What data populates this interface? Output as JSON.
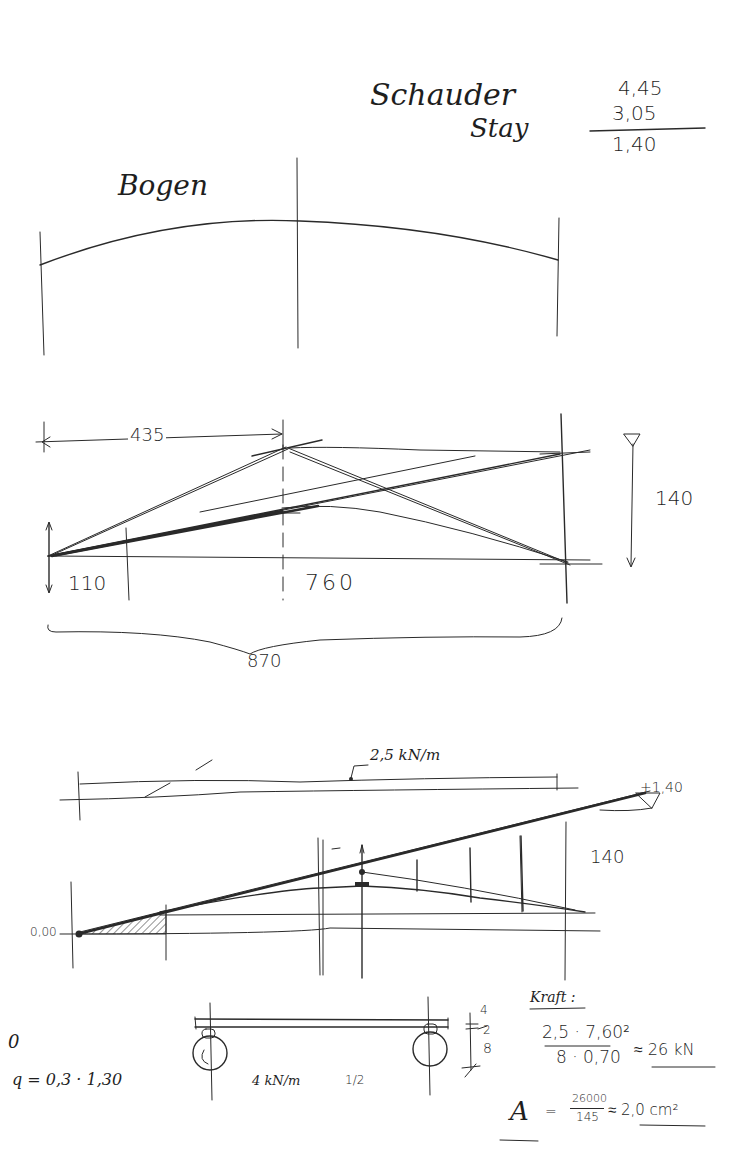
{
  "header": {
    "title_line1": "Schauder",
    "title_line2": "Stay",
    "calc": {
      "a": "4,45",
      "b": "3,05",
      "result": "1,40"
    }
  },
  "sketch1": {
    "label": "Bogen"
  },
  "sketch2": {
    "dim_top": "435",
    "dim_left": "110",
    "dim_mid": "760",
    "dim_total": "870",
    "dim_height": "140"
  },
  "sketch3": {
    "load_label": "2,5 kN/m",
    "level_right": "+1,40",
    "dim_height": "140",
    "level_left": "0,00"
  },
  "sketch4": {
    "left_mark": "0",
    "q_formula": "q = 0,3 · 1,30",
    "load_label": "4 kN/m",
    "half_label": "1/2",
    "dim_small_top": "4",
    "dim_small_mid": "2",
    "dim_small_bot": "8"
  },
  "calc_block": {
    "heading": "Kraft :",
    "numerator": "2,5 · 7,60²",
    "denominator": "8 · 0,70",
    "result": "≈ 26 kN",
    "area_label": "A",
    "area_numerator": "26000",
    "area_denominator": "145",
    "area_result": "≈ 2,0 cm²"
  }
}
